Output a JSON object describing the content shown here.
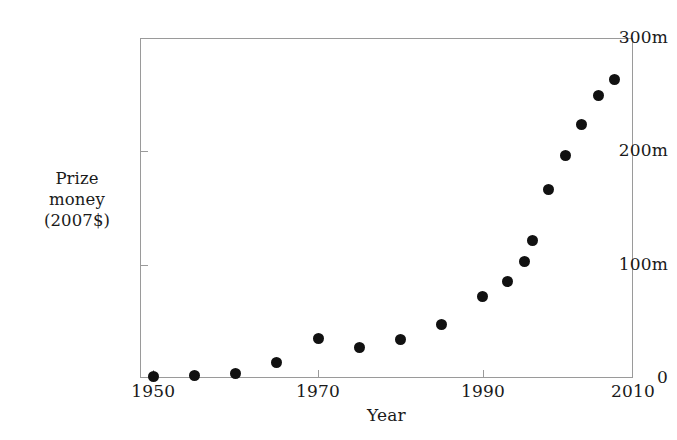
{
  "chart_data": {
    "type": "scatter",
    "title": "",
    "xlabel": "Year",
    "ylabel_lines": [
      "Prize",
      "money",
      "(2007$)"
    ],
    "ylabel": "Prize money (2007$)",
    "xlim": [
      1948.4,
      2008.2
    ],
    "ylim": [
      0,
      300
    ],
    "y_unit": "m",
    "grid": false,
    "legend": null,
    "x_ticks": [
      {
        "value": 1950,
        "label": "1950"
      },
      {
        "value": 1970,
        "label": "1970"
      },
      {
        "value": 1990,
        "label": "1990"
      },
      {
        "value": 2010,
        "label": "2010"
      }
    ],
    "y_ticks": [
      {
        "value": 0,
        "label": "0"
      },
      {
        "value": 100,
        "label": "100m"
      },
      {
        "value": 200,
        "label": "200m"
      },
      {
        "value": 300,
        "label": "300m"
      }
    ],
    "series": [
      {
        "name": "Prize money",
        "marker": "filled-circle",
        "color": "#111111",
        "points": [
          {
            "x": 1950,
            "y": 1
          },
          {
            "x": 1955,
            "y": 2
          },
          {
            "x": 1960,
            "y": 4
          },
          {
            "x": 1965,
            "y": 14
          },
          {
            "x": 1970,
            "y": 35
          },
          {
            "x": 1975,
            "y": 27
          },
          {
            "x": 1980,
            "y": 34
          },
          {
            "x": 1985,
            "y": 47
          },
          {
            "x": 1990,
            "y": 72
          },
          {
            "x": 1993,
            "y": 85
          },
          {
            "x": 1995,
            "y": 103
          },
          {
            "x": 1996,
            "y": 121
          },
          {
            "x": 1998,
            "y": 166
          },
          {
            "x": 2000,
            "y": 196
          },
          {
            "x": 2002,
            "y": 224
          },
          {
            "x": 2004,
            "y": 249
          },
          {
            "x": 2006,
            "y": 263
          }
        ]
      }
    ]
  },
  "figure": {
    "background_color": "#ffffff",
    "frame_color": "#9a9a9a",
    "marker_color": "#111111",
    "text_color": "#1a1a1a"
  }
}
